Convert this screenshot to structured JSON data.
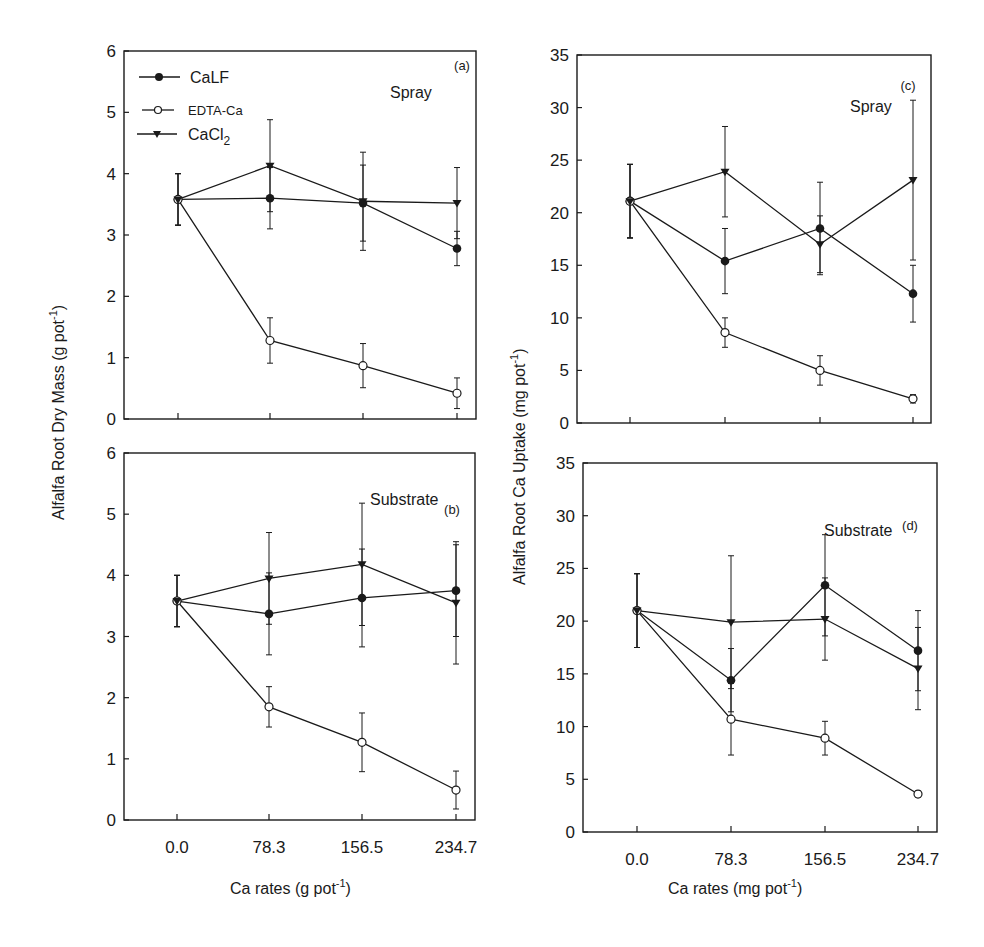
{
  "figure": {
    "x_labels": [
      "0.0",
      "78.3",
      "156.5",
      "234.7"
    ],
    "left_xlabel": "Ca rates (g pot",
    "right_xlabel": "Ca rates (mg pot",
    "xlabel_sup": "-1",
    "left_ylabel": "Alfalfa Root Dry Mass (g pot",
    "right_ylabel": "Alfalfa Root Ca Uptake (mg pot",
    "ylabel_sup": "-1",
    "legend": [
      {
        "name": "CaLF",
        "marker": "filled-circle"
      },
      {
        "name": "EDTA-Ca",
        "marker": "open-circle"
      },
      {
        "name": "CaCl2",
        "marker": "filled-triangle-down"
      }
    ],
    "panels": {
      "a": {
        "tag": "(a)",
        "treatment": "Spray"
      },
      "b": {
        "tag": "(b)",
        "treatment": "Substrate"
      },
      "c": {
        "tag": "(c)",
        "treatment": "Spray"
      },
      "d": {
        "tag": "(d)",
        "treatment": "Substrate"
      }
    }
  },
  "chart_data": [
    {
      "type": "line",
      "panel": "a",
      "title": "Spray",
      "xlabel": "",
      "ylabel": "Alfalfa Root Dry Mass (g pot-1)",
      "categories": [
        "0.0",
        "78.3",
        "156.5",
        "234.7"
      ],
      "ylim": [
        0,
        6
      ],
      "yticks": [
        0,
        1,
        2,
        3,
        4,
        5,
        6
      ],
      "series": [
        {
          "name": "CaLF",
          "values": [
            3.58,
            3.6,
            3.52,
            2.78
          ],
          "errors": [
            0.42,
            0.5,
            0.62,
            0.28
          ]
        },
        {
          "name": "EDTA-Ca",
          "values": [
            3.58,
            1.28,
            0.87,
            0.42
          ],
          "errors": [
            0.42,
            0.37,
            0.36,
            0.25
          ]
        },
        {
          "name": "CaCl2",
          "values": [
            3.58,
            4.13,
            3.55,
            3.52
          ],
          "errors": [
            0.42,
            0.75,
            0.8,
            0.58
          ]
        }
      ]
    },
    {
      "type": "line",
      "panel": "b",
      "title": "Substrate",
      "xlabel": "Ca rates (g pot-1)",
      "ylabel": "Alfalfa Root Dry Mass (g pot-1)",
      "categories": [
        "0.0",
        "78.3",
        "156.5",
        "234.7"
      ],
      "ylim": [
        0,
        6
      ],
      "yticks": [
        0,
        1,
        2,
        3,
        4,
        5,
        6
      ],
      "series": [
        {
          "name": "CaLF",
          "values": [
            3.58,
            3.37,
            3.63,
            3.75
          ],
          "errors": [
            0.42,
            0.67,
            0.8,
            0.75
          ]
        },
        {
          "name": "EDTA-Ca",
          "values": [
            3.58,
            1.85,
            1.27,
            0.49
          ],
          "errors": [
            0.42,
            0.33,
            0.48,
            0.31
          ]
        },
        {
          "name": "CaCl2",
          "values": [
            3.58,
            3.95,
            4.18,
            3.55
          ],
          "errors": [
            0.42,
            0.75,
            1.0,
            1.0
          ]
        }
      ]
    },
    {
      "type": "line",
      "panel": "c",
      "title": "Spray",
      "xlabel": "",
      "ylabel": "Alfalfa Root Ca Uptake (mg pot-1)",
      "categories": [
        "0.0",
        "78.3",
        "156.5",
        "234.7"
      ],
      "ylim": [
        0,
        35
      ],
      "yticks": [
        0,
        5,
        10,
        15,
        20,
        25,
        30,
        35
      ],
      "series": [
        {
          "name": "CaLF",
          "values": [
            21.1,
            15.4,
            18.5,
            12.3
          ],
          "errors": [
            3.5,
            3.1,
            4.4,
            2.7
          ]
        },
        {
          "name": "EDTA-Ca",
          "values": [
            21.1,
            8.6,
            5.0,
            2.3
          ],
          "errors": [
            3.5,
            1.4,
            1.4,
            0.4
          ]
        },
        {
          "name": "CaCl2",
          "values": [
            21.1,
            23.9,
            17.0,
            23.1
          ],
          "errors": [
            3.5,
            4.3,
            2.7,
            7.6
          ]
        }
      ]
    },
    {
      "type": "line",
      "panel": "d",
      "title": "Substrate",
      "xlabel": "Ca rates (mg pot-1)",
      "ylabel": "Alfalfa Root Ca Uptake (mg pot-1)",
      "categories": [
        "0.0",
        "78.3",
        "156.5",
        "234.7"
      ],
      "ylim": [
        0,
        35
      ],
      "yticks": [
        0,
        5,
        10,
        15,
        20,
        25,
        30,
        35
      ],
      "series": [
        {
          "name": "CaLF",
          "values": [
            21.0,
            14.4,
            23.4,
            17.2
          ],
          "errors": [
            3.5,
            3.0,
            4.8,
            3.8
          ]
        },
        {
          "name": "EDTA-Ca",
          "values": [
            21.0,
            10.7,
            8.9,
            3.6
          ],
          "errors": [
            3.5,
            3.4,
            1.6,
            0.3
          ]
        },
        {
          "name": "CaCl2",
          "values": [
            21.0,
            19.9,
            20.2,
            15.5
          ],
          "errors": [
            3.5,
            6.3,
            3.9,
            3.9
          ]
        }
      ]
    }
  ]
}
